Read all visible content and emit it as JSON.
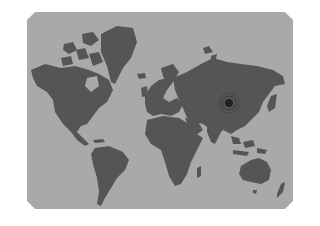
{
  "map": {
    "type": "world-map",
    "projection": "mercator",
    "style": "grayscale silhouette",
    "colors": {
      "ocean": "#a9a9a9",
      "land": "#555555",
      "background": "#ffffff",
      "marker": "#222222"
    },
    "marker": {
      "region": "China",
      "x": 229,
      "y": 103,
      "shape": "concentric-circles"
    },
    "continents": [
      "North America",
      "Greenland",
      "South America",
      "Europe",
      "Africa",
      "Asia",
      "Australia",
      "New Zealand"
    ]
  }
}
